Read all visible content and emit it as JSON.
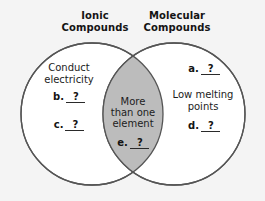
{
  "diagram": {
    "type": "venn-two-set",
    "background_color": "#f4f4f4",
    "circle_stroke_color": "#555555",
    "circle_fill_color": "#ffffff",
    "overlap_fill_color": "#bcbcbc",
    "text_color": "#1a1a1a"
  },
  "headers": {
    "left": {
      "line1": "Ionic",
      "line2": "Compounds"
    },
    "right": {
      "line1": "Molecular",
      "line2": "Compounds"
    }
  },
  "left_set": {
    "phrase": {
      "line1": "Conduct",
      "line2": "electricity"
    },
    "blanks": [
      {
        "letter": "b.",
        "answer": "?"
      },
      {
        "letter": "c.",
        "answer": "?"
      }
    ]
  },
  "overlap_set": {
    "phrase": {
      "line1": "More",
      "line2": "than one",
      "line3": "element"
    },
    "blanks": [
      {
        "letter": "e.",
        "answer": "?"
      }
    ]
  },
  "right_set": {
    "phrase": {
      "line1": "Low melting",
      "line2": "points"
    },
    "blanks": [
      {
        "letter": "a.",
        "answer": "?"
      },
      {
        "letter": "d.",
        "answer": "?"
      }
    ]
  }
}
